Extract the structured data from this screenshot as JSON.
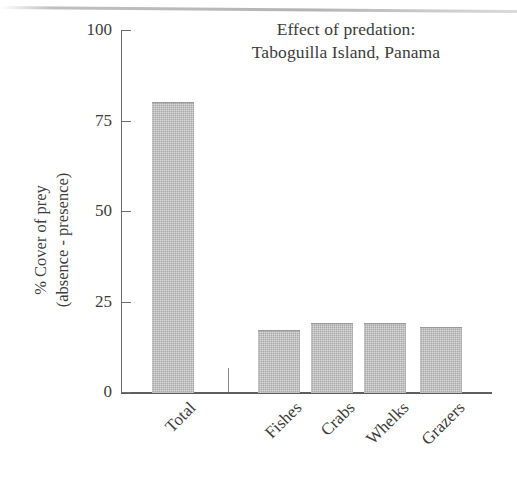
{
  "chart_data": {
    "type": "bar",
    "title": "Effect of predation:\nTaboguilla Island, Panama",
    "title_lines": [
      "Effect of predation:",
      "Taboguilla Island, Panama"
    ],
    "xlabel": "",
    "ylabel": "% Cover of prey\n(absence - presence)",
    "ylabel_lines": [
      "% Cover of prey",
      "(absence - presence)"
    ],
    "categories": [
      "Total",
      "Fishes",
      "Crabs",
      "Whelks",
      "Grazers"
    ],
    "values": [
      80,
      17,
      19,
      19,
      18
    ],
    "ylim": [
      0,
      100
    ],
    "yticks": [
      0,
      25,
      50,
      75,
      100
    ],
    "ytick_labels": [
      "0",
      "25",
      "50",
      "75",
      "100"
    ],
    "grid": false,
    "legend": false,
    "bar_color": "#a9a9a9",
    "axis_color": "#6d6d6d",
    "text_color": "#3c3c3c"
  }
}
